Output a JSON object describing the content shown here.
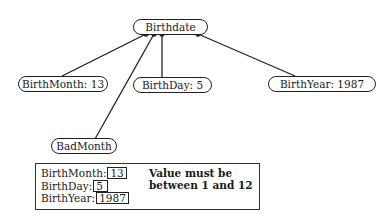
{
  "diagram": {
    "root": {
      "label": "Birthdate"
    },
    "children": [
      {
        "id": "month",
        "label": "BirthMonth:  13"
      },
      {
        "id": "day",
        "label": "BirthDay: 5"
      },
      {
        "id": "year",
        "label": "BirthYear:  1987"
      },
      {
        "id": "bad",
        "label": "BadMonth"
      }
    ]
  },
  "form": {
    "fields": [
      {
        "label": "BirthMonth:",
        "value": "13"
      },
      {
        "label": "BirthDay:",
        "value": "5"
      },
      {
        "label": "BirthYear:",
        "value": "1987"
      }
    ],
    "error": "Value must be between 1 and 12"
  }
}
